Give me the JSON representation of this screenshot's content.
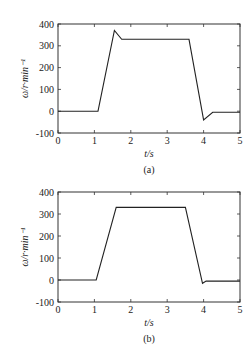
{
  "header_fragment": "",
  "chart_data": [
    {
      "type": "line",
      "caption": "(a)",
      "title": "",
      "xlabel": "t/s",
      "ylabel": "ω/r·min⁻¹",
      "xlim": [
        0,
        5
      ],
      "ylim": [
        -100,
        400
      ],
      "xticks": [
        0,
        1,
        2,
        3,
        4,
        5
      ],
      "yticks": [
        -100,
        0,
        100,
        200,
        300,
        400
      ],
      "grid": false,
      "legend": null,
      "series": [
        {
          "name": "speed",
          "x": [
            0,
            1.1,
            1.55,
            1.75,
            3.6,
            4.0,
            4.25,
            5.0
          ],
          "y": [
            0,
            0,
            370,
            330,
            330,
            -40,
            -5,
            -5
          ]
        }
      ]
    },
    {
      "type": "line",
      "caption": "(b)",
      "title": "",
      "xlabel": "t/s",
      "ylabel": "ω/r·min⁻¹",
      "xlim": [
        0,
        5
      ],
      "ylim": [
        -100,
        400
      ],
      "xticks": [
        0,
        1,
        2,
        3,
        4,
        5
      ],
      "yticks": [
        -100,
        0,
        100,
        200,
        300,
        400
      ],
      "grid": false,
      "legend": null,
      "series": [
        {
          "name": "speed",
          "x": [
            0,
            1.05,
            1.6,
            3.5,
            3.97,
            4.07,
            5.0
          ],
          "y": [
            0,
            0,
            330,
            330,
            -15,
            -5,
            -5
          ]
        }
      ]
    }
  ]
}
